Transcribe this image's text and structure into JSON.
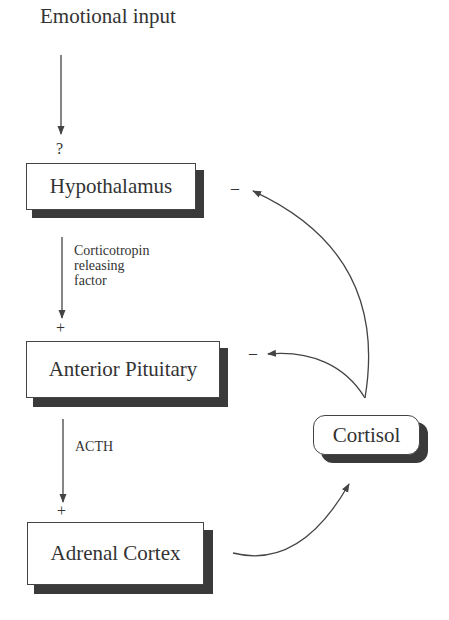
{
  "diagram": {
    "title": "Emotional input",
    "input_marker": "?",
    "nodes": {
      "hypothalamus": "Hypothalamus",
      "anterior_pituitary": "Anterior Pituitary",
      "adrenal_cortex": "Adrenal Cortex",
      "cortisol": "Cortisol"
    },
    "edges": {
      "crf_label": [
        "Corticotropin",
        "releasing",
        "factor"
      ],
      "acth_label": "ACTH",
      "stimulate_sign": "+",
      "inhibit_sign": "–"
    },
    "colors": {
      "line": "#444444",
      "shadow": "#3a3a3a",
      "text": "#333333"
    }
  }
}
